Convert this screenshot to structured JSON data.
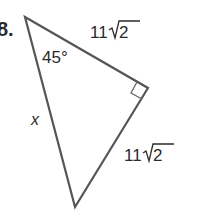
{
  "problem": {
    "number": "8."
  },
  "triangle": {
    "vertices": [
      "top",
      "right",
      "bottom"
    ],
    "right_angle_at": "right",
    "angle_label": "45°",
    "side_top": {
      "coefficient": "11",
      "radicand": "2"
    },
    "side_right": {
      "coefficient": "11",
      "radicand": "2"
    },
    "side_left": {
      "label": "x"
    }
  },
  "colors": {
    "stroke": "#555555",
    "text": "#2b2b2b",
    "background": "#ffffff"
  }
}
